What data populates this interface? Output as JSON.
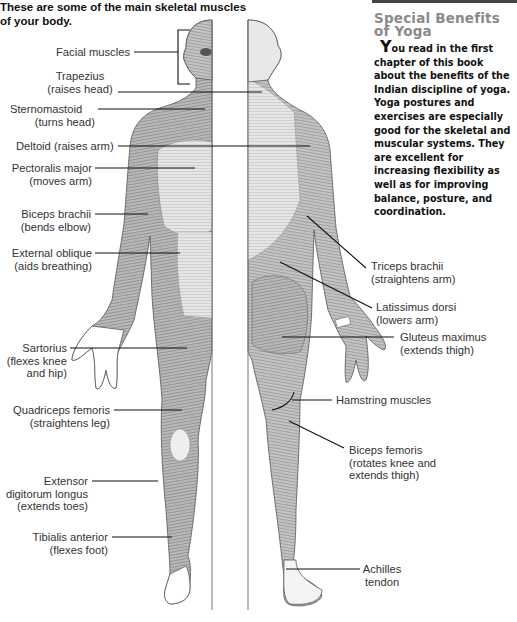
{
  "intro_text": "These are some of the main skeletal muscles of your body.",
  "sidebar": {
    "title_line1": "Special Benefits",
    "title_line2": "of Yoga",
    "dropcap": "Y",
    "body": "ou read in the first chapter of this book about the benefits of the Indian discipline of yoga. Yoga postures and exercises are especially good for the skeletal and muscular systems. They are excellent for increasing flexibility as well as for improving balance, posture, and coordination."
  },
  "figure": {
    "front_labels": [
      {
        "name": "Facial muscles",
        "action": ""
      },
      {
        "name": "Trapezius",
        "action": "(raises head)"
      },
      {
        "name": "Sternomastoid",
        "action": "(turns head)"
      },
      {
        "name": "Deltoid (raises arm)",
        "action": ""
      },
      {
        "name": "Pectoralis major",
        "action": "(moves arm)"
      },
      {
        "name": "Biceps brachii",
        "action": "(bends elbow)"
      },
      {
        "name": "External oblique",
        "action": "(aids breathing)"
      },
      {
        "name": "Sartorius",
        "action": "(flexes knee",
        "action2": "and hip)"
      },
      {
        "name": "Quadriceps femoris",
        "action": "(straightens leg)"
      },
      {
        "name": "Extensor",
        "action": "digitorum longus",
        "action2": "(extends toes)"
      },
      {
        "name": "Tibialis anterior",
        "action": "(flexes foot)"
      }
    ],
    "back_labels": [
      {
        "name": "Triceps brachii",
        "action": "(straightens arm)"
      },
      {
        "name": "Latissimus dorsi",
        "action": "(lowers arm)"
      },
      {
        "name": "Gluteus maximus",
        "action": "(extends thigh)"
      },
      {
        "name": "Hamstring muscles",
        "action": ""
      },
      {
        "name": "Biceps femoris",
        "action": "(rotates knee and",
        "action2": "extends thigh)"
      },
      {
        "name": "Achilles",
        "action": "tendon"
      }
    ]
  }
}
